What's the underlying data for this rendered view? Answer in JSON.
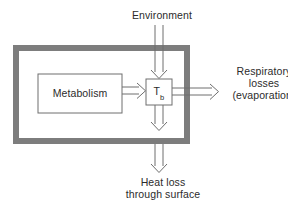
{
  "diagram": {
    "colors": {
      "frame": "#7d7d7d",
      "stroke": "#6e6e6e",
      "text": "#2b2b2b",
      "background": "#ffffff"
    },
    "labels": {
      "environment": "Environment",
      "metabolism": "Metabolism",
      "body_temp_symbol": "T",
      "body_temp_subscript": "b",
      "respiratory_line1": "Respiratory",
      "respiratory_line2": "losses",
      "respiratory_line3": "(evaporation)",
      "heat_loss_line1": "Heat loss",
      "heat_loss_line2": "through surface"
    },
    "arrows": [
      {
        "name": "environment-to-body",
        "direction": "down",
        "from": "Environment",
        "to": "T_b"
      },
      {
        "name": "metabolism-to-body",
        "direction": "right",
        "from": "Metabolism",
        "to": "T_b"
      },
      {
        "name": "body-to-respiratory",
        "direction": "right",
        "from": "T_b",
        "to": "Respiratory losses (evaporation)"
      },
      {
        "name": "body-to-surface-inner",
        "direction": "down",
        "from": "T_b",
        "to": "body surface"
      },
      {
        "name": "surface-to-heat-loss",
        "direction": "down",
        "from": "body surface",
        "to": "Heat loss through surface"
      }
    ]
  }
}
